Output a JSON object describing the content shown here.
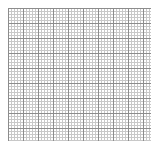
{
  "canvas": {
    "width": 158,
    "height": 149,
    "background_color": "#ffffff"
  },
  "chart_data": {
    "type": "heatmap",
    "title": "",
    "subtitle": "",
    "xlabel": "",
    "ylabel": "",
    "legend_position": "none",
    "grid": true,
    "tick_labels_visible": false,
    "axis_line_visible": false,
    "categories": [],
    "values": [],
    "series": []
  },
  "grid": {
    "name": "graph-paper-grid",
    "left": 8,
    "top": 8,
    "width": 143,
    "height": 133,
    "minor_spacing_px": 3,
    "minor_line_width_px": 1,
    "minor_color": "#c8c8c8",
    "major_spacing_px": 15,
    "major_line_width_px": 1,
    "major_color": "#8c8c8c",
    "cell_fill_color": "#ffffff",
    "minor_columns": 48,
    "minor_rows": 45,
    "major_columns": 10,
    "major_rows": 9
  }
}
